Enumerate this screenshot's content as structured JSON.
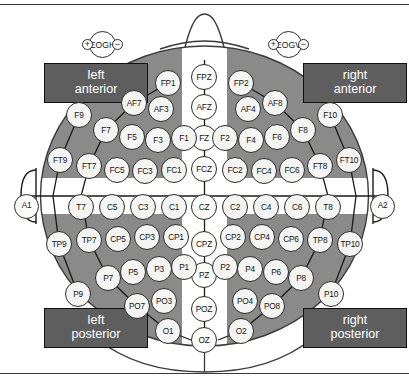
{
  "figure": {
    "kind": "eeg-electrode-montage"
  },
  "colors": {
    "region_fill": "#8a8a8a",
    "label_box_fill": "#5e5e5e",
    "label_box_text": "#ffffff",
    "electrode_fill": "#f4f4f2",
    "outline": "#2a2a2a",
    "background": "#ffffff"
  },
  "region_labels": [
    {
      "id": "left-anterior",
      "line1": "left",
      "line2": "anterior",
      "x": 44,
      "y": 63,
      "w": 104,
      "h": 40
    },
    {
      "id": "right-anterior",
      "line1": "right",
      "line2": "anterior",
      "x": 303,
      "y": 63,
      "w": 104,
      "h": 40
    },
    {
      "id": "left-posterior",
      "line1": "left",
      "line2": "posterior",
      "x": 44,
      "y": 308,
      "w": 104,
      "h": 40
    },
    {
      "id": "right-posterior",
      "line1": "right",
      "line2": "posterior",
      "x": 303,
      "y": 308,
      "w": 104,
      "h": 40
    }
  ],
  "eog": [
    {
      "id": "EOGH",
      "label": "EOGH",
      "plus": "+",
      "minus": "−",
      "x": 82,
      "y": 31
    },
    {
      "id": "EOGV",
      "label": "EOGV",
      "plus": "+",
      "minus": "−",
      "x": 268,
      "y": 31
    }
  ],
  "ear_electrodes": [
    {
      "label": "A1",
      "x": 14,
      "y": 194,
      "side": "left"
    },
    {
      "label": "A2",
      "x": 370,
      "y": 194,
      "side": "right"
    }
  ],
  "midline_electrodes": [
    {
      "label": "FPZ",
      "x": 191,
      "y": 64
    },
    {
      "label": "AFZ",
      "x": 191,
      "y": 94
    },
    {
      "label": "FZ",
      "x": 191,
      "y": 125
    },
    {
      "label": "FCZ",
      "x": 191,
      "y": 156
    },
    {
      "label": "CZ",
      "x": 191,
      "y": 194
    },
    {
      "label": "CPZ",
      "x": 191,
      "y": 231
    },
    {
      "label": "PZ",
      "x": 191,
      "y": 262
    },
    {
      "label": "POZ",
      "x": 191,
      "y": 296
    },
    {
      "label": "OZ",
      "x": 191,
      "y": 327
    }
  ],
  "left_anterior_electrodes": [
    {
      "label": "FP1",
      "x": 155,
      "y": 70
    },
    {
      "label": "AF7",
      "x": 121,
      "y": 90
    },
    {
      "label": "AF3",
      "x": 148,
      "y": 96
    },
    {
      "label": "F9",
      "x": 66,
      "y": 102
    },
    {
      "label": "F7",
      "x": 93,
      "y": 117
    },
    {
      "label": "F5",
      "x": 119,
      "y": 124
    },
    {
      "label": "F3",
      "x": 145,
      "y": 127
    },
    {
      "label": "F1",
      "x": 171,
      "y": 125
    },
    {
      "label": "FT9",
      "x": 47,
      "y": 147
    },
    {
      "label": "FT7",
      "x": 76,
      "y": 153
    },
    {
      "label": "FC5",
      "x": 104,
      "y": 157
    },
    {
      "label": "FC3",
      "x": 132,
      "y": 158
    },
    {
      "label": "FC1",
      "x": 161,
      "y": 157
    }
  ],
  "right_anterior_electrodes": [
    {
      "label": "FP2",
      "x": 228,
      "y": 70
    },
    {
      "label": "AF8",
      "x": 262,
      "y": 90
    },
    {
      "label": "AF4",
      "x": 235,
      "y": 96
    },
    {
      "label": "F10",
      "x": 317,
      "y": 102
    },
    {
      "label": "F8",
      "x": 290,
      "y": 117
    },
    {
      "label": "F6",
      "x": 264,
      "y": 124
    },
    {
      "label": "F4",
      "x": 238,
      "y": 127
    },
    {
      "label": "F2",
      "x": 212,
      "y": 125
    },
    {
      "label": "FT10",
      "x": 336,
      "y": 147
    },
    {
      "label": "FT8",
      "x": 307,
      "y": 153
    },
    {
      "label": "FC6",
      "x": 279,
      "y": 157
    },
    {
      "label": "FC4",
      "x": 251,
      "y": 158
    },
    {
      "label": "FC2",
      "x": 222,
      "y": 157
    }
  ],
  "central_row_left": [
    {
      "label": "T7",
      "x": 68,
      "y": 194
    },
    {
      "label": "C5",
      "x": 99,
      "y": 194
    },
    {
      "label": "C3",
      "x": 130,
      "y": 194
    },
    {
      "label": "C1",
      "x": 161,
      "y": 194
    }
  ],
  "central_row_right": [
    {
      "label": "C2",
      "x": 222,
      "y": 194
    },
    {
      "label": "C4",
      "x": 253,
      "y": 194
    },
    {
      "label": "C6",
      "x": 284,
      "y": 194
    },
    {
      "label": "T8",
      "x": 315,
      "y": 194
    }
  ],
  "left_posterior_electrodes": [
    {
      "label": "TP9",
      "x": 46,
      "y": 231
    },
    {
      "label": "TP7",
      "x": 76,
      "y": 227
    },
    {
      "label": "CP5",
      "x": 105,
      "y": 226
    },
    {
      "label": "CP3",
      "x": 134,
      "y": 224
    },
    {
      "label": "CP1",
      "x": 163,
      "y": 224
    },
    {
      "label": "P9",
      "x": 65,
      "y": 281
    },
    {
      "label": "P7",
      "x": 95,
      "y": 265
    },
    {
      "label": "P5",
      "x": 120,
      "y": 259
    },
    {
      "label": "P3",
      "x": 146,
      "y": 256
    },
    {
      "label": "P1",
      "x": 171,
      "y": 254
    },
    {
      "label": "PO7",
      "x": 124,
      "y": 293
    },
    {
      "label": "PO3",
      "x": 151,
      "y": 288
    },
    {
      "label": "O1",
      "x": 155,
      "y": 318
    }
  ],
  "right_posterior_electrodes": [
    {
      "label": "TP10",
      "x": 337,
      "y": 231
    },
    {
      "label": "TP8",
      "x": 307,
      "y": 227
    },
    {
      "label": "CP6",
      "x": 278,
      "y": 226
    },
    {
      "label": "CP4",
      "x": 249,
      "y": 224
    },
    {
      "label": "CP2",
      "x": 220,
      "y": 224
    },
    {
      "label": "P10",
      "x": 318,
      "y": 281
    },
    {
      "label": "P8",
      "x": 288,
      "y": 265
    },
    {
      "label": "P6",
      "x": 263,
      "y": 259
    },
    {
      "label": "P4",
      "x": 237,
      "y": 256
    },
    {
      "label": "P2",
      "x": 212,
      "y": 254
    },
    {
      "label": "PO8",
      "x": 259,
      "y": 293
    },
    {
      "label": "PO4",
      "x": 232,
      "y": 288
    },
    {
      "label": "O2",
      "x": 228,
      "y": 318
    }
  ]
}
